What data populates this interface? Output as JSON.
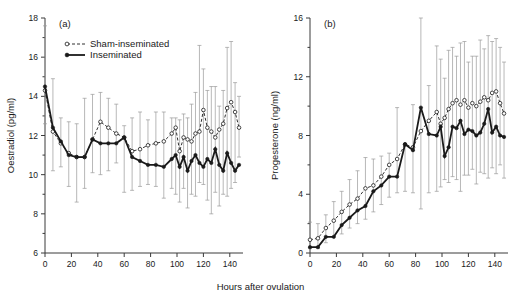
{
  "figure": {
    "xlabel": "Hours after ovulation",
    "legend": {
      "sham_label": "Sham-inseminated",
      "inseminated_label": "Inseminated"
    }
  },
  "chart_data": [
    {
      "type": "line",
      "panel_label": "(a)",
      "title": "",
      "xlabel": "Hours after ovulation",
      "ylabel": "Oestradiol (pg/ml)",
      "xlim": [
        0,
        150
      ],
      "ylim": [
        6,
        18
      ],
      "xticks": [
        0,
        20,
        40,
        60,
        80,
        100,
        120,
        140
      ],
      "yticks": [
        6,
        8,
        10,
        12,
        14,
        16,
        18
      ],
      "yticks_minor": [
        7,
        9,
        11,
        13,
        15,
        17
      ],
      "grid": false,
      "legend_position": "top-left",
      "error_bars": "SD",
      "series": [
        {
          "name": "Sham-inseminated",
          "marker": "open-circle",
          "linestyle": "dashed",
          "x": [
            0,
            6,
            12,
            18,
            24,
            30,
            36,
            42,
            48,
            54,
            60,
            66,
            72,
            78,
            84,
            90,
            96,
            99,
            102,
            105,
            108,
            111,
            114,
            117,
            120,
            123,
            126,
            129,
            132,
            135,
            138,
            141,
            144,
            147
          ],
          "values": [
            14.3,
            12.2,
            11.6,
            11.1,
            10.9,
            10.9,
            11.8,
            12.7,
            12.4,
            12.1,
            11.9,
            11.2,
            11.3,
            11.5,
            11.6,
            11.7,
            12.1,
            12.4,
            11.2,
            11.9,
            11.8,
            11.7,
            12.1,
            12.2,
            13.3,
            12.4,
            12.2,
            11.9,
            12.3,
            12.6,
            13.4,
            13.7,
            13.2,
            12.4
          ],
          "err_upper": [
            17.6,
            14.9,
            12.9,
            12.7,
            12.6,
            13.9,
            14.1,
            14.2,
            13.9,
            13.6,
            12.5,
            12.9,
            13.2,
            12.8,
            13.2,
            13.2,
            12.9,
            12.9,
            12.8,
            13.1,
            12.9,
            13.6,
            14.2,
            16.6,
            15.4,
            14.3,
            14.5,
            14.5,
            13.5,
            14.3,
            16.5,
            16.8,
            14.7,
            14.0
          ],
          "err_lower": [
            12.6,
            10.2,
            10.4,
            9.4,
            8.6,
            9.3,
            10.1,
            10.0,
            10.2,
            10.6,
            9.1,
            9.2,
            9.4,
            9.5,
            9.4,
            8.8,
            9.3,
            9.0,
            8.6,
            9.3,
            8.3,
            9.0,
            8.9,
            9.6,
            9.5,
            8.7,
            8.0,
            9.1,
            8.4,
            9.0,
            8.9,
            9.3,
            9.6,
            10.9
          ]
        },
        {
          "name": "Inseminated",
          "marker": "filled-circle",
          "linestyle": "solid",
          "x": [
            0,
            6,
            12,
            18,
            24,
            30,
            36,
            42,
            48,
            54,
            60,
            66,
            72,
            78,
            84,
            90,
            96,
            99,
            102,
            105,
            108,
            111,
            114,
            117,
            120,
            123,
            126,
            129,
            132,
            135,
            138,
            141,
            144,
            147
          ],
          "values": [
            14.5,
            12.4,
            11.7,
            11.0,
            10.9,
            10.9,
            11.8,
            11.6,
            11.6,
            11.6,
            11.9,
            10.9,
            10.7,
            10.5,
            10.5,
            10.4,
            10.8,
            11.0,
            10.4,
            10.9,
            10.2,
            10.7,
            11.0,
            10.6,
            10.4,
            10.8,
            10.6,
            11.3,
            10.5,
            10.2,
            11.1,
            10.6,
            10.2,
            10.5
          ],
          "err_upper": [
            17.6,
            14.9,
            12.9,
            12.7,
            12.6,
            13.9,
            14.1,
            14.2,
            13.9,
            13.6,
            12.5,
            12.9,
            13.2,
            12.8,
            13.2,
            13.2,
            12.9,
            12.9,
            12.8,
            13.1,
            12.9,
            13.6,
            14.2,
            16.6,
            15.4,
            14.3,
            14.5,
            14.5,
            13.5,
            14.3,
            16.5,
            16.8,
            14.7,
            14.0
          ],
          "err_lower": [
            12.6,
            10.2,
            10.4,
            9.4,
            8.6,
            9.3,
            10.1,
            10.0,
            10.2,
            10.6,
            9.1,
            9.2,
            9.4,
            9.5,
            9.4,
            8.8,
            9.3,
            9.0,
            8.6,
            9.3,
            8.3,
            9.0,
            8.9,
            9.6,
            9.5,
            8.7,
            8.0,
            9.1,
            8.4,
            9.0,
            8.9,
            9.3,
            9.6,
            10.9
          ]
        }
      ]
    },
    {
      "type": "line",
      "panel_label": "(b)",
      "title": "",
      "xlabel": "Hours after ovulation",
      "ylabel": "Progesterone (ng/ml)",
      "xlim": [
        0,
        150
      ],
      "ylim": [
        0,
        16
      ],
      "xticks": [
        0,
        20,
        40,
        60,
        80,
        100,
        120,
        140
      ],
      "yticks": [
        0,
        4,
        8,
        12,
        16
      ],
      "yticks_minor": [
        2,
        6,
        10,
        14
      ],
      "grid": false,
      "legend_position": "none",
      "error_bars": "SD",
      "series": [
        {
          "name": "Sham-inseminated",
          "marker": "open-circle",
          "linestyle": "dashed",
          "x": [
            0,
            6,
            12,
            18,
            24,
            30,
            36,
            42,
            48,
            54,
            60,
            66,
            72,
            78,
            84,
            90,
            96,
            99,
            102,
            105,
            108,
            111,
            114,
            117,
            120,
            123,
            126,
            129,
            132,
            135,
            138,
            141,
            144,
            147
          ],
          "values": [
            0.9,
            1.0,
            1.7,
            2.2,
            2.8,
            3.3,
            3.7,
            4.4,
            4.6,
            5.2,
            6.0,
            6.4,
            7.4,
            7.2,
            8.3,
            9.0,
            9.6,
            8.8,
            9.2,
            9.8,
            10.2,
            10.4,
            10.1,
            10.4,
            9.9,
            10.2,
            10.0,
            10.3,
            10.6,
            10.4,
            10.9,
            11.0,
            10.2,
            9.5
          ],
          "err_upper": [
            2.1,
            2.0,
            2.6,
            3.5,
            4.2,
            5.0,
            5.6,
            6.5,
            6.4,
            6.6,
            6.8,
            9.9,
            7.4,
            10.1,
            16.0,
            11.4,
            14.1,
            13.2,
            11.9,
            13.8,
            14.0,
            13.4,
            14.3,
            14.4,
            13.0,
            13.4,
            13.4,
            14.5,
            13.9,
            14.8,
            14.4,
            14.6,
            14.0,
            13.0
          ],
          "err_lower": [
            0.3,
            0.3,
            0.7,
            1.1,
            1.3,
            1.7,
            2.0,
            2.3,
            2.8,
            3.3,
            3.8,
            4.1,
            4.2,
            4.1,
            3.0,
            4.1,
            4.2,
            4.5,
            5.0,
            4.8,
            5.2,
            5.0,
            4.2,
            5.3,
            5.3,
            5.7,
            4.7,
            5.5,
            5.4,
            5.1,
            5.8,
            5.4,
            6.0,
            5.1
          ]
        },
        {
          "name": "Inseminated",
          "marker": "filled-circle",
          "linestyle": "solid",
          "x": [
            0,
            6,
            12,
            18,
            24,
            30,
            36,
            42,
            48,
            54,
            60,
            66,
            72,
            78,
            84,
            90,
            96,
            99,
            102,
            105,
            108,
            111,
            114,
            117,
            120,
            123,
            126,
            129,
            132,
            135,
            138,
            141,
            144,
            147
          ],
          "values": [
            0.4,
            0.4,
            1.1,
            1.1,
            1.9,
            2.4,
            2.9,
            3.2,
            4.2,
            4.6,
            5.2,
            5.2,
            7.4,
            7.0,
            9.9,
            8.1,
            8.0,
            8.6,
            6.6,
            7.2,
            8.6,
            8.5,
            9.0,
            8.1,
            8.4,
            8.3,
            8.0,
            8.2,
            8.8,
            9.8,
            8.2,
            8.6,
            8.0,
            7.9
          ],
          "err_upper": [
            2.1,
            2.0,
            2.6,
            3.5,
            4.2,
            5.0,
            5.6,
            6.5,
            6.4,
            6.6,
            6.8,
            9.9,
            7.4,
            10.1,
            16.0,
            11.4,
            14.1,
            13.2,
            11.9,
            13.8,
            14.0,
            13.4,
            14.3,
            14.4,
            13.0,
            13.4,
            13.4,
            14.5,
            13.9,
            14.8,
            14.4,
            14.6,
            14.0,
            13.0
          ],
          "err_lower": [
            0.3,
            0.3,
            0.7,
            1.1,
            1.3,
            1.7,
            2.0,
            2.3,
            2.8,
            3.3,
            3.8,
            4.1,
            4.2,
            4.1,
            3.0,
            4.1,
            4.2,
            4.5,
            5.0,
            4.8,
            5.2,
            5.0,
            4.2,
            5.3,
            5.3,
            5.7,
            4.7,
            5.5,
            5.4,
            5.1,
            5.8,
            5.4,
            6.0,
            5.1
          ]
        }
      ]
    }
  ]
}
